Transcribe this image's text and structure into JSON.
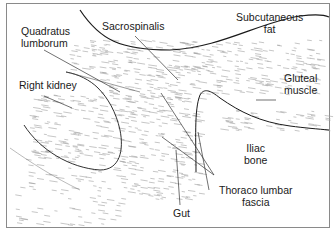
{
  "diagram": {
    "type": "anatomical cross-section line drawing",
    "labels": {
      "subcutaneous_fat": [
        "Subcutaneous",
        "fat"
      ],
      "quadratus_lumborum": [
        "Quadratus",
        "lumborum"
      ],
      "sacrospinalis": [
        "Sacrospinalis"
      ],
      "right_kidney": [
        "Right kidney"
      ],
      "gluteal_muscle": [
        "Gluteal",
        "muscle"
      ],
      "iliac_bone": [
        "Iliac",
        "bone"
      ],
      "thoraco_lumbar_fascia": [
        "Thoraco lumbar",
        "fascia"
      ],
      "gut": [
        "Gut"
      ]
    },
    "colors": {
      "ink": "#1a1a1a",
      "texture": "#9a9a9a",
      "border": "#8a8a8a"
    }
  }
}
